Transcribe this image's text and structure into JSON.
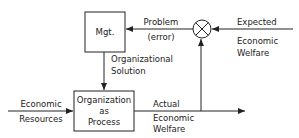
{
  "diagram": {
    "type": "feedback-control-block-diagram",
    "colors": {
      "line": "#222222",
      "background": "#ffffff"
    },
    "blocks": {
      "management": {
        "label": "Mgt."
      },
      "organization": {
        "lines": [
          "Organization",
          "as",
          "Process"
        ]
      }
    },
    "comparator": {
      "symbol": "summing-junction-x"
    },
    "signals": {
      "problem": {
        "lines": [
          "Problem",
          "(error)"
        ]
      },
      "expected": {
        "lines": [
          "Expected",
          "Economic",
          "Welfare"
        ]
      },
      "solution": {
        "lines": [
          "Organizational",
          "Solution"
        ]
      },
      "resources": {
        "lines": [
          "Economic",
          "Resources"
        ]
      },
      "actual": {
        "lines": [
          "Actual",
          "Economic",
          "Welfare"
        ]
      }
    }
  }
}
